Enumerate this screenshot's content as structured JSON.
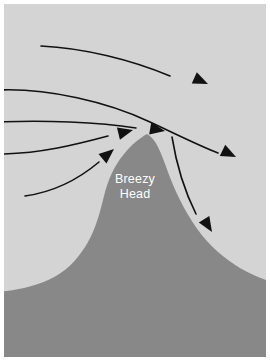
{
  "figure": {
    "type": "diagram",
    "width": 270,
    "height": 361,
    "frame_color": "#ffffff",
    "sky_color": "#d4d4d4",
    "terrain_color": "#888888",
    "stroke_color": "#111111",
    "label_color": "#ffffff"
  },
  "labels": {
    "peak_line_1": "Breezy",
    "peak_line_2": "Head"
  },
  "terrain": {
    "name": "Breezy Head",
    "peak_x": 143,
    "peak_y": 130,
    "path": "M -6,353 L -6,288 C 14,286 34,282 52,272 C 66,264 76,252 84,238 C 92,224 96,208 100,192 C 104,176 110,162 120,150 C 128,140 136,134 143,130 C 150,134 154,142 158,152 C 163,165 168,180 176,196 C 186,216 198,234 214,248 C 230,262 248,272 268,278 L 268,353 Z"
  },
  "streamlines": [
    {
      "name": "streamline-1-upper",
      "path": "M 37,42 C 80,44 128,56 166,72",
      "arrow_tip_x": 204,
      "arrow_tip_y": 80,
      "arrow_angle": 24
    },
    {
      "name": "streamline-2-over-crest",
      "path": "M -6,86 C 44,84 104,98 146,118 C 176,132 196,142 214,149",
      "arrow_tip_x": 232,
      "arrow_tip_y": 153,
      "arrow_angle": 26
    },
    {
      "name": "streamline-3-crest-impact",
      "path": "M -6,118 C 40,116 94,118 132,124",
      "arrow_tip_x": 161,
      "arrow_tip_y": 127,
      "arrow_angle": 10
    },
    {
      "name": "streamline-4-windward",
      "path": "M -6,150 C 36,150 74,140 104,132",
      "arrow_tip_x": 129,
      "arrow_tip_y": 126,
      "arrow_angle": -14
    },
    {
      "name": "streamline-5-lower-windward",
      "path": "M 21,192 C 50,188 76,174 95,158",
      "arrow_tip_x": 110,
      "arrow_tip_y": 145,
      "arrow_angle": -40
    },
    {
      "name": "streamline-6-lee-descent",
      "path": "M 168,133 C 172,158 180,186 192,210",
      "arrow_tip_x": 208,
      "arrow_tip_y": 228,
      "arrow_angle": 58
    }
  ],
  "chart_data": {
    "type": "diagram",
    "annotations": [
      "Breezy",
      "Head"
    ],
    "flow_direction": "left to right",
    "streamline_count": 6
  }
}
